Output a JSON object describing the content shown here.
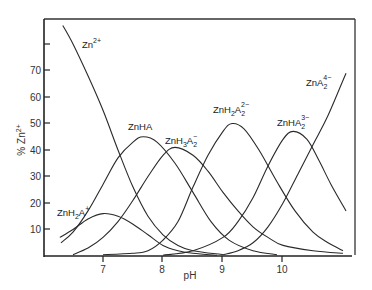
{
  "chart_data": {
    "type": "line",
    "title": "",
    "xlabel": "pH",
    "ylabel": "% Zn2+",
    "xlim": [
      6.0,
      11.2
    ],
    "ylim": [
      0,
      87
    ],
    "x_ticks": [
      7,
      8,
      9,
      10
    ],
    "y_ticks": [
      10,
      20,
      30,
      40,
      50,
      60,
      70,
      80
    ],
    "y_tick_labels": [
      "10",
      "20",
      "30",
      "40",
      "50",
      "60",
      "70",
      ""
    ],
    "grid": false,
    "legend": "inline labels",
    "series": [
      {
        "name": "Zn2+",
        "label_html": "Zn<sup>2+</sup>",
        "points": [
          [
            6.33,
            87
          ],
          [
            6.5,
            80
          ],
          [
            6.75,
            68
          ],
          [
            7.0,
            55
          ],
          [
            7.25,
            40
          ],
          [
            7.5,
            26
          ],
          [
            7.75,
            15
          ],
          [
            8.0,
            8
          ],
          [
            8.25,
            4
          ],
          [
            8.5,
            2
          ],
          [
            9.0,
            0.5
          ]
        ]
      },
      {
        "name": "ZnH2A+",
        "points": [
          [
            6.28,
            7
          ],
          [
            6.5,
            10
          ],
          [
            6.75,
            14
          ],
          [
            7.0,
            16
          ],
          [
            7.25,
            15
          ],
          [
            7.5,
            12
          ],
          [
            7.75,
            8
          ],
          [
            8.0,
            4
          ],
          [
            8.25,
            2
          ],
          [
            8.5,
            1
          ],
          [
            8.9,
            0.3
          ]
        ]
      },
      {
        "name": "ZnHA",
        "points": [
          [
            6.3,
            5
          ],
          [
            6.5,
            9
          ],
          [
            6.75,
            17
          ],
          [
            7.0,
            27
          ],
          [
            7.25,
            37
          ],
          [
            7.5,
            43
          ],
          [
            7.67,
            45
          ],
          [
            7.9,
            43
          ],
          [
            8.2,
            35
          ],
          [
            8.5,
            24
          ],
          [
            8.8,
            13
          ],
          [
            9.1,
            6
          ],
          [
            9.5,
            2
          ],
          [
            9.9,
            0.5
          ]
        ]
      },
      {
        "name": "ZnH3A2-",
        "points": [
          [
            6.5,
            0.5
          ],
          [
            6.75,
            3
          ],
          [
            7.0,
            7
          ],
          [
            7.25,
            13
          ],
          [
            7.5,
            21
          ],
          [
            7.75,
            30
          ],
          [
            8.0,
            38
          ],
          [
            8.2,
            41
          ],
          [
            8.5,
            38
          ],
          [
            8.75,
            32
          ],
          [
            9.0,
            24
          ],
          [
            9.25,
            17
          ],
          [
            9.5,
            11
          ],
          [
            9.75,
            7
          ],
          [
            10.0,
            4
          ],
          [
            10.5,
            2
          ],
          [
            11.0,
            1
          ]
        ]
      },
      {
        "name": "ZnH2A2 2-",
        "points": [
          [
            7.0,
            0.5
          ],
          [
            7.5,
            1
          ],
          [
            7.75,
            2
          ],
          [
            8.0,
            6
          ],
          [
            8.25,
            13
          ],
          [
            8.5,
            26
          ],
          [
            8.75,
            38
          ],
          [
            9.0,
            47
          ],
          [
            9.15,
            50
          ],
          [
            9.35,
            48
          ],
          [
            9.6,
            40
          ],
          [
            9.9,
            28
          ],
          [
            10.2,
            17
          ],
          [
            10.5,
            9
          ],
          [
            10.75,
            5
          ],
          [
            11.0,
            2
          ]
        ]
      },
      {
        "name": "ZnHA2 3-",
        "points": [
          [
            8.0,
            0.3
          ],
          [
            8.5,
            2
          ],
          [
            9.0,
            7
          ],
          [
            9.25,
            13
          ],
          [
            9.5,
            22
          ],
          [
            9.75,
            34
          ],
          [
            10.0,
            44
          ],
          [
            10.17,
            47
          ],
          [
            10.4,
            44
          ],
          [
            10.6,
            36
          ],
          [
            10.8,
            27
          ],
          [
            11.05,
            17
          ]
        ]
      },
      {
        "name": "ZnA2 4-",
        "points": [
          [
            9.0,
            0.5
          ],
          [
            9.25,
            2
          ],
          [
            9.5,
            5
          ],
          [
            9.75,
            11
          ],
          [
            10.0,
            20
          ],
          [
            10.25,
            31
          ],
          [
            10.5,
            42
          ],
          [
            10.75,
            53
          ],
          [
            11.05,
            69
          ]
        ]
      }
    ],
    "annotations": [
      {
        "text": "Zn2+",
        "x": 6.47,
        "y": 80
      },
      {
        "text": "ZnHA",
        "x": 7.5,
        "y": 49
      },
      {
        "text": "ZnH3A2-",
        "x": 8.0,
        "y": 43
      },
      {
        "text": "ZnH2A2 2-",
        "x": 8.85,
        "y": 53
      },
      {
        "text": "ZnHA2 3-",
        "x": 9.8,
        "y": 50
      },
      {
        "text": "ZnA2 4-",
        "x": 10.6,
        "y": 74
      },
      {
        "text": "ZnH2A+",
        "x": 6.25,
        "y": 16
      }
    ]
  },
  "labels": {
    "xlabel": "pH",
    "ylabel_prefix": "%",
    "ylabel_main": "Zn",
    "ylabel_sup": "2+",
    "x_tick_7": "7",
    "x_tick_8": "8",
    "x_tick_9": "9",
    "x_tick_10": "10",
    "y_tick_10": "10",
    "y_tick_20": "20",
    "y_tick_30": "30",
    "y_tick_40": "40",
    "y_tick_50": "50",
    "y_tick_60": "60",
    "y_tick_70": "70",
    "zn": {
      "base": "Zn",
      "sup": "2+"
    },
    "znh2a": {
      "base": "ZnH",
      "sub1": "2",
      "mid": "A",
      "sup": "+"
    },
    "znha": {
      "base": "ZnHA"
    },
    "znh3a2": {
      "base": "ZnH",
      "sub1": "3",
      "mid": "A",
      "sub2": "2",
      "sup": "−"
    },
    "znh2a2": {
      "base": "ZnH",
      "sub1": "2",
      "mid": "A",
      "sub2": "2",
      "sup": "2−"
    },
    "znha2": {
      "base": "ZnHA",
      "sub2": "2",
      "sup": "3−"
    },
    "zna2": {
      "base": "ZnA",
      "sub2": "2",
      "sup": "4−"
    }
  }
}
